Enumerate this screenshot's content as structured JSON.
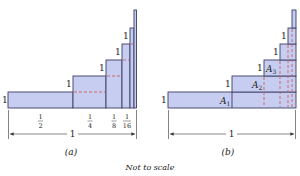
{
  "colors": {
    "fill": "#c7cdf0",
    "stroke": "#3a3f66",
    "dash": "#d0605a",
    "text": "#222222",
    "axis": "#333333"
  },
  "diagram_a": {
    "caption": "(a)",
    "height_labels": [
      "1",
      "1",
      "1",
      "1",
      "1"
    ],
    "width_fractions": [
      {
        "num": "1",
        "den": "2"
      },
      {
        "num": "1",
        "den": "4"
      },
      {
        "num": "1",
        "den": "8"
      },
      {
        "num": "1",
        "den": "16"
      }
    ],
    "total_width_label": "1"
  },
  "diagram_b": {
    "caption": "(b)",
    "height_labels": [
      "1",
      "1",
      "1",
      "1",
      "1"
    ],
    "area_labels": [
      {
        "base": "A",
        "sub": "1"
      },
      {
        "base": "A",
        "sub": "2"
      },
      {
        "base": "A",
        "sub": "3"
      }
    ],
    "total_width_label": "1"
  },
  "footnote": "Not to scale"
}
